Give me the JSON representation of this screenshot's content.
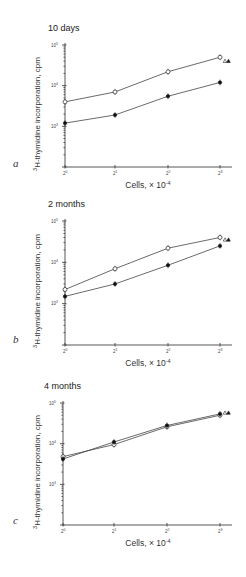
{
  "figure": {
    "panels": [
      {
        "letter": "a",
        "title": "10 days",
        "ylabel": "3H-thymidine incorporation, cpm",
        "xlabel": "Cells, × 10-4"
      },
      {
        "letter": "b",
        "title": "2 months",
        "ylabel": "3H-thymidine incorporation, cpm",
        "xlabel": "Cells, × 10-4"
      },
      {
        "letter": "c",
        "title": "4 months",
        "ylabel": "3H-thymidine incorporation, cpm",
        "xlabel": "Cells, × 10-4"
      }
    ]
  },
  "chart_data": [
    {
      "type": "line",
      "title": "10 days",
      "panel": "a",
      "xlabel": "Cells, × 10^-4",
      "ylabel": "3H-thymidine incorporation, cpm",
      "x": [
        1,
        2,
        4,
        8
      ],
      "x_tick_labels": [
        "2^0",
        "2^1",
        "2^2",
        "2^3"
      ],
      "y_scale": "log",
      "y_tick_labels": [
        "10^3",
        "10^4",
        "10^5"
      ],
      "ylim": [
        100,
        100000
      ],
      "series": [
        {
          "name": "open circles",
          "marker": "open-circle",
          "values": [
            4000,
            7000,
            22000,
            50000
          ]
        },
        {
          "name": "filled circles",
          "marker": "filled-circle",
          "values": [
            1200,
            1900,
            5500,
            12000
          ]
        }
      ],
      "extra_markers": [
        {
          "marker": "open-triangle",
          "x": 8,
          "value": 40000
        },
        {
          "marker": "filled-triangle",
          "x": 8,
          "value": 40000
        }
      ]
    },
    {
      "type": "line",
      "title": "2 months",
      "panel": "b",
      "xlabel": "Cells, × 10^-4",
      "ylabel": "3H-thymidine incorporation, cpm",
      "x": [
        1,
        2,
        4,
        8
      ],
      "x_tick_labels": [
        "2^0",
        "2^1",
        "2^2",
        "2^3"
      ],
      "y_scale": "log",
      "y_tick_labels": [
        "10^3",
        "10^4",
        "10^5"
      ],
      "ylim": [
        100,
        100000
      ],
      "series": [
        {
          "name": "open circles",
          "marker": "open-circle",
          "values": [
            2200,
            7000,
            22000,
            40000
          ]
        },
        {
          "name": "filled circles",
          "marker": "filled-circle",
          "values": [
            1500,
            3000,
            8500,
            25000
          ]
        }
      ],
      "extra_markers": [
        {
          "marker": "open-triangle",
          "x": 8,
          "value": 35000
        },
        {
          "marker": "filled-triangle",
          "x": 8,
          "value": 35000
        }
      ]
    },
    {
      "type": "line",
      "title": "4 months",
      "panel": "c",
      "xlabel": "Cells, × 10^-4",
      "ylabel": "3H-thymidine incorporation, cpm",
      "x": [
        1,
        2,
        4,
        8
      ],
      "x_tick_labels": [
        "2^0",
        "2^1",
        "2^2",
        "2^3"
      ],
      "y_scale": "log",
      "y_tick_labels": [
        "10^3",
        "10^4",
        "10^5"
      ],
      "ylim": [
        100,
        100000
      ],
      "series": [
        {
          "name": "open circles",
          "marker": "open-circle",
          "values": [
            4800,
            9500,
            26000,
            50000
          ]
        },
        {
          "name": "filled circles",
          "marker": "filled-circle",
          "values": [
            4200,
            11000,
            28000,
            54000
          ]
        }
      ],
      "extra_markers": [
        {
          "marker": "open-triangle",
          "x": 8,
          "value": 57000
        },
        {
          "marker": "filled-triangle",
          "x": 8,
          "value": 57000
        }
      ]
    }
  ]
}
